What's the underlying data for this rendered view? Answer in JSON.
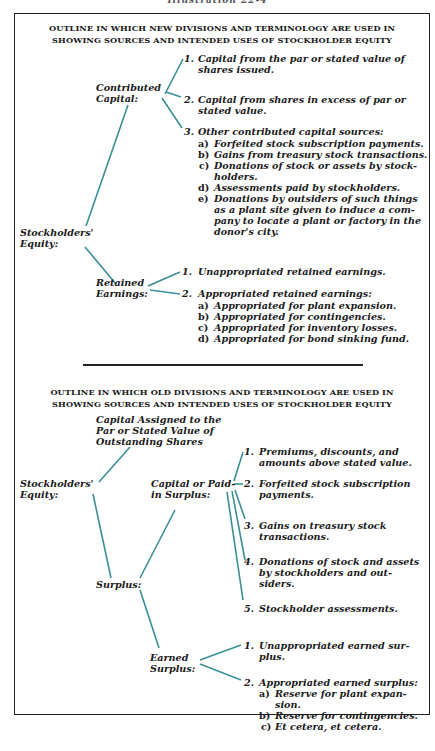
{
  "caption": "Illustration 22-4",
  "colors": {
    "connector": "#3a8f95",
    "text": "#1a1a1a",
    "border": "#222222"
  },
  "new_outline": {
    "title_line1": "OUTLINE IN WHICH NEW DIVISIONS AND TERMINOLOGY ARE USED IN",
    "title_line2": "SHOWING SOURCES AND INTENDED USES OF STOCKHOLDER EQUITY",
    "root": "Stockholders' Equity:",
    "root_l1": "Stockholders'",
    "root_l2": "Equity:",
    "contributed": {
      "label_l1": "Contributed",
      "label_l2": "Capital:",
      "items": [
        {
          "num": "1.",
          "l1": "Capital from the par or stated value of",
          "l2": "shares issued."
        },
        {
          "num": "2.",
          "l1": "Capital from shares in excess of par or",
          "l2": "stated value."
        },
        {
          "num": "3.",
          "l1": "Other contributed capital sources:"
        }
      ],
      "sub_items": [
        {
          "letter": "a)",
          "l1": "Forfeited stock subscription payments."
        },
        {
          "letter": "b)",
          "l1": "Gains from treasury stock transactions."
        },
        {
          "letter": "c)",
          "l1": "Donations of stock or assets by stock-",
          "l2": "holders."
        },
        {
          "letter": "d)",
          "l1": "Assessments paid by stockholders."
        },
        {
          "letter": "e)",
          "l1": "Donations by outsiders of such things",
          "l2": "as a plant site given to induce a com-",
          "l3": "pany to locate a plant or factory in the",
          "l4": "donor's city."
        }
      ]
    },
    "retained": {
      "label_l1": "Retained",
      "label_l2": "Earnings:",
      "items": [
        {
          "num": "1.",
          "l1": "Unappropriated retained earnings."
        },
        {
          "num": "2.",
          "l1": "Appropriated retained earnings:"
        }
      ],
      "sub_items": [
        {
          "letter": "a)",
          "l1": "Appropriated for plant expansion."
        },
        {
          "letter": "b)",
          "l1": "Appropriated for contingencies."
        },
        {
          "letter": "c)",
          "l1": "Appropriated for inventory losses."
        },
        {
          "letter": "d)",
          "l1": "Appropriated for bond sinking fund."
        }
      ]
    }
  },
  "old_outline": {
    "title_line1": "OUTLINE IN WHICH OLD DIVISIONS AND TERMINOLOGY ARE USED IN",
    "title_line2": "SHOWING SOURCES AND INTENDED USES OF STOCKHOLDER EQUITY",
    "root_l1": "Stockholders'",
    "root_l2": "Equity:",
    "capital_assigned": {
      "l1": "Capital Assigned to the",
      "l2": "Par or Stated Value of",
      "l3": "Outstanding Shares"
    },
    "surplus": "Surplus:",
    "paid_in": {
      "label_l1": "Capital or Paid-",
      "label_l2": "in Surplus:",
      "items": [
        {
          "num": "1.",
          "l1": "Premiums, discounts, and",
          "l2": "amounts above stated value."
        },
        {
          "num": "2.",
          "l1": "Forfeited stock subscription",
          "l2": "payments."
        },
        {
          "num": "3.",
          "l1": "Gains on treasury stock",
          "l2": "transactions."
        },
        {
          "num": "4.",
          "l1": "Donations of stock and assets",
          "l2": "by stockholders and out-",
          "l3": "siders."
        },
        {
          "num": "5.",
          "l1": "Stockholder assessments."
        }
      ]
    },
    "earned": {
      "label_l1": "Earned",
      "label_l2": "Surplus:",
      "items": [
        {
          "num": "1.",
          "l1": "Unappropriated earned sur-",
          "l2": "plus."
        },
        {
          "num": "2.",
          "l1": "Appropriated earned surplus:"
        }
      ],
      "sub_items": [
        {
          "letter": "a)",
          "l1": "Reserve for plant expan-",
          "l2": "sion."
        },
        {
          "letter": "b)",
          "l1": "Reserve for contingencies."
        },
        {
          "letter": "c)",
          "l1": "Et cetera, et cetera."
        }
      ]
    }
  }
}
